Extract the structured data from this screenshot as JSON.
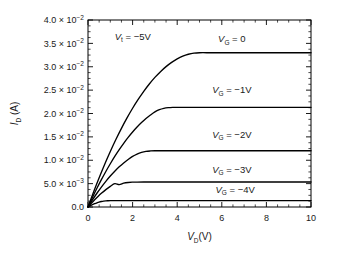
{
  "figure": {
    "background": "#ffffff",
    "line_color": "#000000",
    "text_color": "#1a1a1a"
  },
  "chart_data": {
    "type": "line",
    "title": "",
    "subtitle": "",
    "xlabel_main": "V",
    "xlabel_sub": "D",
    "xlabel_unit": "(V)",
    "xlabel": "VD(V)",
    "ylabel_main": "I",
    "ylabel_sub": "D",
    "ylabel_unit": "(A)",
    "ylabel": "ID (A)",
    "xlim": [
      0,
      10
    ],
    "ylim": [
      0,
      0.04
    ],
    "grid": false,
    "legend_position": "inline-annotations",
    "xticks": [
      0,
      2,
      4,
      6,
      8,
      10
    ],
    "xticklabels": [
      "0",
      "2",
      "4",
      "6",
      "8",
      "10"
    ],
    "x_minor_tick_step": 0.5,
    "yticks": [
      0,
      0.005,
      0.01,
      0.015,
      0.02,
      0.025,
      0.03,
      0.035,
      0.04
    ],
    "yticklabels": [
      {
        "mantissa": "0.0",
        "times": "",
        "base": "",
        "exp": ""
      },
      {
        "mantissa": "5.0",
        "times": "×",
        "base": "10",
        "exp": "−3"
      },
      {
        "mantissa": "1.0",
        "times": "×",
        "base": "10",
        "exp": "−2"
      },
      {
        "mantissa": "1.5",
        "times": "×",
        "base": "10",
        "exp": "−2"
      },
      {
        "mantissa": "2.0",
        "times": "×",
        "base": "10",
        "exp": "−2"
      },
      {
        "mantissa": "2.5",
        "times": "×",
        "base": "10",
        "exp": "−2"
      },
      {
        "mantissa": "3.0",
        "times": "×",
        "base": "10",
        "exp": "−2"
      },
      {
        "mantissa": "3.5",
        "times": "×",
        "base": "10",
        "exp": "−2"
      },
      {
        "mantissa": "4.0",
        "times": "×",
        "base": "10",
        "exp": "−2"
      }
    ],
    "y_minor_tick_step": 0.00125,
    "annotations": [
      {
        "name": "threshold-voltage",
        "symbol": "V",
        "sub": "t",
        "text": " = −5V",
        "full": "Vt = −5V",
        "x": 1.2,
        "y": 0.0358
      }
    ],
    "series": [
      {
        "name": "VG = 0",
        "label_symbol": "V",
        "label_sub": "G",
        "label_text": " = 0",
        "gate_voltage": 0,
        "saturation_current": 0.033,
        "knee_voltage": 5.0,
        "label_x": 6.45,
        "label_y": 0.0352,
        "x": [
          0,
          0.25,
          0.5,
          0.75,
          1,
          1.25,
          1.5,
          1.75,
          2,
          2.25,
          2.5,
          2.75,
          3,
          3.25,
          3.5,
          3.75,
          4,
          4.25,
          4.5,
          4.75,
          5,
          5.5,
          6,
          7,
          8,
          9,
          10
        ],
        "y": [
          0,
          0.00322,
          0.00627,
          0.00916,
          0.01188,
          0.01444,
          0.01683,
          0.01905,
          0.02112,
          0.02301,
          0.02475,
          0.02631,
          0.02772,
          0.02895,
          0.03003,
          0.03094,
          0.03168,
          0.03226,
          0.03267,
          0.03292,
          0.033,
          0.033,
          0.033,
          0.033,
          0.033,
          0.033,
          0.033
        ]
      },
      {
        "name": "VG = -1V",
        "label_symbol": "V",
        "label_sub": "G",
        "label_text": " = −1V",
        "gate_voltage": -1,
        "saturation_current": 0.0211,
        "knee_voltage": 4.0,
        "label_x": 6.45,
        "label_y": 0.0243,
        "x": [
          0,
          0.2,
          0.4,
          0.6,
          0.8,
          1,
          1.2,
          1.4,
          1.6,
          1.8,
          2,
          2.2,
          2.4,
          2.6,
          2.8,
          3,
          3.2,
          3.4,
          3.6,
          3.8,
          4,
          4.5,
          5,
          6,
          7,
          8,
          9,
          10
        ],
        "y": [
          0,
          0.00205,
          0.004,
          0.00585,
          0.0076,
          0.00925,
          0.01081,
          0.01226,
          0.01362,
          0.01488,
          0.01604,
          0.0171,
          0.01806,
          0.01892,
          0.01968,
          0.02035,
          0.02081,
          0.02109,
          0.02124,
          0.0213,
          0.02132,
          0.02132,
          0.02132,
          0.02132,
          0.02132,
          0.02132,
          0.02132,
          0.02132
        ]
      },
      {
        "name": "VG = -2V",
        "label_symbol": "V",
        "label_sub": "G",
        "label_text": " = −2V",
        "gate_voltage": -2,
        "saturation_current": 0.012,
        "knee_voltage": 3.0,
        "label_x": 6.45,
        "label_y": 0.0148,
        "x": [
          0,
          0.2,
          0.4,
          0.6,
          0.8,
          1,
          1.2,
          1.4,
          1.6,
          1.8,
          2,
          2.2,
          2.4,
          2.6,
          2.8,
          3,
          3.3,
          3.6,
          4,
          5,
          6,
          7,
          8,
          9,
          10
        ],
        "y": [
          0,
          0.00152,
          0.00294,
          0.00426,
          0.00549,
          0.00662,
          0.00765,
          0.00859,
          0.00943,
          0.01017,
          0.01082,
          0.01131,
          0.01167,
          0.01189,
          0.01199,
          0.01203,
          0.01204,
          0.01204,
          0.01204,
          0.01204,
          0.01204,
          0.01204,
          0.01204,
          0.01204,
          0.01204
        ]
      },
      {
        "name": "VG = -3V",
        "label_symbol": "V",
        "label_sub": "G",
        "label_text": " = −3V",
        "gate_voltage": -3,
        "saturation_current": 0.0053,
        "knee_voltage": 2.0,
        "label_x": 6.45,
        "label_y": 0.0073,
        "x": [
          0,
          0.15,
          0.3,
          0.45,
          0.6,
          0.8,
          1,
          1.2,
          1.4,
          1.6,
          1.8,
          2,
          2.2,
          2.5,
          3,
          4,
          5,
          6,
          7,
          8,
          9,
          10
        ],
        "y": [
          0,
          0.0008,
          0.00155,
          0.00226,
          0.00292,
          0.00372,
          0.00442,
          0.00499,
          0.00479,
          0.0051,
          0.00525,
          0.00531,
          0.00533,
          0.00534,
          0.00534,
          0.00534,
          0.00534,
          0.00534,
          0.00534,
          0.00534,
          0.00534,
          0.00534
        ]
      },
      {
        "name": "VG = -4V",
        "label_symbol": "V",
        "label_sub": "G",
        "label_text": " = −4V",
        "gate_voltage": -4,
        "saturation_current": 0.00132,
        "knee_voltage": 1.0,
        "label_x": 6.6,
        "label_y": 0.0031,
        "x": [
          0,
          0.1,
          0.2,
          0.3,
          0.4,
          0.5,
          0.6,
          0.7,
          0.8,
          0.9,
          1,
          1.2,
          1.5,
          2,
          3,
          4,
          5,
          6,
          7,
          8,
          9,
          10
        ],
        "y": [
          0,
          0.00026,
          0.0005,
          0.00071,
          0.0009,
          0.00106,
          0.00118,
          0.00127,
          0.00132,
          0.00134,
          0.00135,
          0.00135,
          0.00135,
          0.00135,
          0.00135,
          0.00135,
          0.00135,
          0.00135,
          0.00135,
          0.00135,
          0.00135,
          0.00135
        ]
      }
    ]
  }
}
